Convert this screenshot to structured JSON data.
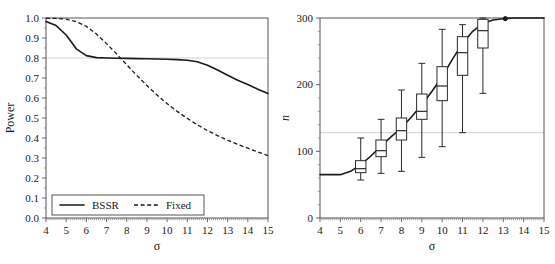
{
  "figure": {
    "panel_count": 2,
    "background": "#ffffff",
    "line_color": "#1a1a1a",
    "refline_color": "#d2d2d2",
    "frame_color": "#555555"
  },
  "chart_data": [
    {
      "type": "line",
      "panel": "left",
      "title": "",
      "xlabel": "σ",
      "ylabel": "Power",
      "xlim": [
        4,
        15
      ],
      "ylim": [
        0.0,
        1.0
      ],
      "grid": false,
      "reference_lines": [
        {
          "axis": "y",
          "value": 0.8,
          "color": "#d2d2d2"
        }
      ],
      "xticks": [
        4,
        5,
        6,
        7,
        8,
        9,
        10,
        11,
        12,
        13,
        14,
        15
      ],
      "xticklabels": [
        "4",
        "5",
        "6",
        "7",
        "8",
        "9",
        "10",
        "11",
        "12",
        "13",
        "14",
        "15"
      ],
      "yticks": [
        0.0,
        0.1,
        0.2,
        0.3,
        0.4,
        0.5,
        0.6,
        0.7,
        0.8,
        0.9,
        1.0
      ],
      "yticklabels": [
        "0.0",
        "0.1",
        "0.2",
        "0.3",
        "0.4",
        "0.5",
        "0.6",
        "0.7",
        "0.8",
        "0.9",
        "1.0"
      ],
      "legend": {
        "position": "lower-left",
        "entries": [
          {
            "label": "BSSR",
            "style": "solid"
          },
          {
            "label": "Fixed",
            "style": "dashed"
          }
        ]
      },
      "x": [
        4,
        4.5,
        5,
        5.5,
        6,
        6.5,
        7,
        7.5,
        8,
        8.5,
        9,
        9.5,
        10,
        10.5,
        11,
        11.5,
        12,
        12.5,
        13,
        13.5,
        14,
        14.5,
        15
      ],
      "series": [
        {
          "name": "BSSR",
          "style": "solid",
          "values": [
            0.983,
            0.962,
            0.915,
            0.846,
            0.812,
            0.802,
            0.8,
            0.799,
            0.798,
            0.797,
            0.796,
            0.795,
            0.794,
            0.792,
            0.789,
            0.781,
            0.764,
            0.74,
            0.714,
            0.689,
            0.667,
            0.644,
            0.623
          ]
        },
        {
          "name": "Fixed",
          "style": "dashed",
          "values": [
            0.999,
            0.998,
            0.994,
            0.982,
            0.958,
            0.92,
            0.872,
            0.82,
            0.766,
            0.713,
            0.662,
            0.615,
            0.572,
            0.533,
            0.498,
            0.466,
            0.437,
            0.412,
            0.389,
            0.368,
            0.349,
            0.33,
            0.312
          ]
        }
      ]
    },
    {
      "type": "line",
      "panel": "right",
      "title": "",
      "xlabel": "σ",
      "ylabel": "n",
      "ylabel_italic": true,
      "xlim": [
        4,
        15
      ],
      "ylim": [
        0,
        300
      ],
      "grid": false,
      "reference_lines": [
        {
          "axis": "y",
          "value": 128,
          "color": "#d2d2d2"
        }
      ],
      "xticks": [
        4,
        5,
        6,
        7,
        8,
        9,
        10,
        11,
        12,
        13,
        14,
        15
      ],
      "xticklabels": [
        "4",
        "5",
        "6",
        "7",
        "8",
        "9",
        "10",
        "11",
        "12",
        "13",
        "14",
        "15"
      ],
      "yticks": [
        0,
        100,
        200,
        300
      ],
      "yticklabels": [
        "0",
        "100",
        "200",
        "300"
      ],
      "mean_curve": {
        "name": "mean n",
        "style": "solid",
        "x": [
          4,
          4.5,
          5,
          5.5,
          6,
          6.5,
          7,
          7.5,
          8,
          8.5,
          9,
          9.5,
          10,
          10.5,
          11,
          11.5,
          12,
          12.5,
          13,
          13.5,
          14,
          14.5,
          15
        ],
        "values": [
          65,
          65,
          65,
          70,
          80,
          93,
          108,
          122,
          135,
          152,
          170,
          190,
          212,
          238,
          262,
          280,
          292,
          297,
          299,
          300,
          300,
          300,
          300
        ]
      },
      "marker_points": [
        {
          "x": 13.1,
          "y": 299
        }
      ],
      "boxplots": [
        {
          "x": 6,
          "min": 57,
          "q1": 68,
          "median": 74,
          "q3": 86,
          "max": 120
        },
        {
          "x": 7,
          "min": 67,
          "q1": 92,
          "median": 101,
          "q3": 117,
          "max": 148
        },
        {
          "x": 8,
          "min": 70,
          "q1": 117,
          "median": 131,
          "q3": 150,
          "max": 192
        },
        {
          "x": 9,
          "min": 91,
          "q1": 148,
          "median": 160,
          "q3": 186,
          "max": 232
        },
        {
          "x": 10,
          "min": 107,
          "q1": 176,
          "median": 198,
          "q3": 227,
          "max": 283
        },
        {
          "x": 11,
          "min": 128,
          "q1": 214,
          "median": 248,
          "q3": 272,
          "max": 290
        },
        {
          "x": 12,
          "min": 187,
          "q1": 255,
          "median": 281,
          "q3": 298,
          "max": 300
        }
      ]
    }
  ]
}
